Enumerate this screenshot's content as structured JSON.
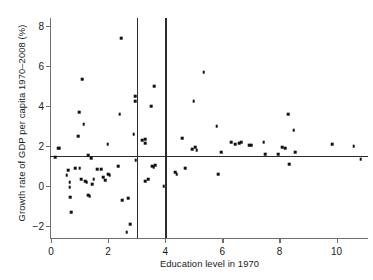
{
  "chart_data": {
    "type": "scatter",
    "title": "",
    "xlabel": "Education level in 1970",
    "ylabel": "Growth rate of GDP per capita 1970–2008 (%)",
    "xlim": [
      0,
      11.1
    ],
    "ylim": [
      -2.6,
      8.4
    ],
    "xticks": [
      0,
      2,
      4,
      6,
      8,
      10
    ],
    "xtick_labels": [
      "0",
      "2",
      "4",
      "6",
      "8",
      "10"
    ],
    "yticks": [
      -2,
      0,
      2,
      4,
      6,
      8
    ],
    "ytick_labels": [
      "−2",
      "0",
      "2",
      "4",
      "6",
      "8"
    ],
    "grid": false,
    "legend": null,
    "marker_color": "#111111",
    "reference_lines": {
      "horizontal": [
        1.5
      ],
      "vertical": [
        3.0,
        4.0
      ],
      "color": "#2b2b2b"
    },
    "points": [
      [
        0.15,
        1.45
      ],
      [
        0.25,
        1.9
      ],
      [
        0.3,
        1.9
      ],
      [
        0.55,
        0.55
      ],
      [
        0.6,
        0.8
      ],
      [
        0.65,
        0.2
      ],
      [
        0.65,
        -0.05
      ],
      [
        0.68,
        -0.55
      ],
      [
        0.7,
        -1.3
      ],
      [
        0.85,
        0.9
      ],
      [
        0.95,
        2.5
      ],
      [
        0.98,
        3.7
      ],
      [
        1.0,
        0.9
      ],
      [
        1.05,
        0.35
      ],
      [
        1.1,
        5.35
      ],
      [
        1.15,
        3.1
      ],
      [
        1.2,
        0.25
      ],
      [
        1.25,
        0.2
      ],
      [
        1.3,
        -0.45
      ],
      [
        1.3,
        1.55
      ],
      [
        1.35,
        -0.5
      ],
      [
        1.4,
        1.4
      ],
      [
        1.45,
        0.1
      ],
      [
        1.5,
        0.35
      ],
      [
        1.62,
        0.85
      ],
      [
        1.75,
        0.85
      ],
      [
        1.82,
        0.45
      ],
      [
        1.9,
        0.3
      ],
      [
        1.98,
        2.1
      ],
      [
        2.0,
        0.6
      ],
      [
        2.05,
        0.55
      ],
      [
        2.35,
        1.0
      ],
      [
        2.4,
        3.6
      ],
      [
        2.45,
        7.4
      ],
      [
        2.5,
        -0.7
      ],
      [
        2.65,
        -2.3
      ],
      [
        2.7,
        -0.6
      ],
      [
        2.78,
        -1.9
      ],
      [
        2.9,
        2.6
      ],
      [
        2.95,
        4.25
      ],
      [
        2.95,
        4.5
      ],
      [
        2.97,
        1.3
      ],
      [
        3.2,
        2.3
      ],
      [
        3.3,
        2.15
      ],
      [
        3.3,
        2.35
      ],
      [
        3.3,
        0.25
      ],
      [
        3.4,
        0.35
      ],
      [
        3.5,
        4.0
      ],
      [
        3.55,
        1.0
      ],
      [
        3.6,
        0.95
      ],
      [
        3.62,
        5.0
      ],
      [
        3.65,
        1.05
      ],
      [
        3.95,
        0.0
      ],
      [
        4.35,
        0.7
      ],
      [
        4.4,
        0.6
      ],
      [
        4.6,
        2.4
      ],
      [
        4.7,
        0.9
      ],
      [
        4.95,
        1.85
      ],
      [
        5.0,
        4.25
      ],
      [
        5.05,
        1.95
      ],
      [
        5.1,
        1.8
      ],
      [
        5.35,
        5.7
      ],
      [
        5.8,
        3.0
      ],
      [
        5.85,
        0.6
      ],
      [
        5.95,
        1.7
      ],
      [
        6.3,
        2.2
      ],
      [
        6.45,
        2.1
      ],
      [
        6.6,
        2.15
      ],
      [
        6.65,
        2.2
      ],
      [
        6.95,
        2.05
      ],
      [
        7.0,
        2.05
      ],
      [
        7.45,
        2.2
      ],
      [
        7.5,
        1.6
      ],
      [
        7.95,
        1.6
      ],
      [
        8.1,
        1.95
      ],
      [
        8.2,
        1.9
      ],
      [
        8.3,
        3.6
      ],
      [
        8.35,
        1.1
      ],
      [
        8.5,
        2.8
      ],
      [
        8.55,
        1.7
      ],
      [
        9.85,
        2.1
      ],
      [
        10.6,
        2.0
      ],
      [
        10.85,
        1.35
      ]
    ]
  }
}
